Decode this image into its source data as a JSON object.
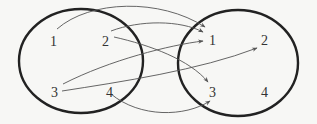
{
  "diagram": {
    "type": "mapping",
    "domain_set": {
      "name": "left-set",
      "elements": [
        "1",
        "2",
        "3",
        "4"
      ]
    },
    "codomain_set": {
      "name": "right-set",
      "elements": [
        "1",
        "2",
        "3",
        "4"
      ]
    },
    "arrows": [
      {
        "from": "1",
        "to": "1"
      },
      {
        "from": "2",
        "to": "1"
      },
      {
        "from": "2",
        "to": "3"
      },
      {
        "from": "3",
        "to": "1"
      },
      {
        "from": "3",
        "to": "2"
      },
      {
        "from": "4",
        "to": "3"
      }
    ],
    "colors": {
      "set_outline": "#222222",
      "arrow": "#555555",
      "label": "#333333",
      "background": "#f7f7f5"
    }
  }
}
